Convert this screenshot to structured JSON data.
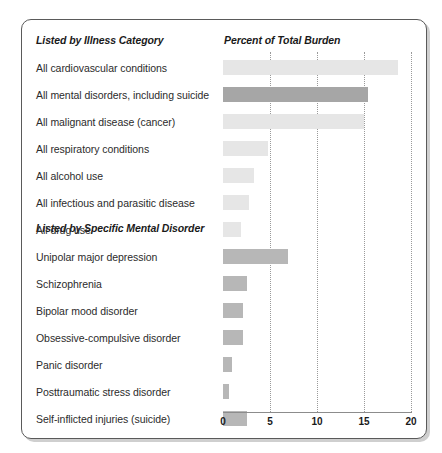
{
  "headers": {
    "illness_category": "Listed by Illness Category",
    "percent_of_total_burden": "Percent of Total Burden",
    "specific_mental_disorder": "Listed by Specific Mental Disorder"
  },
  "axis": {
    "ticks": [
      "0",
      "5",
      "10",
      "15",
      "20"
    ]
  },
  "colors": {
    "bar_light": "#e6e6e6",
    "bar_dark": "#a6a6a6",
    "bar_mid": "#b7b7b7",
    "frame": "#5a5a5a",
    "gridline": "#9a9a9a",
    "text": "#2b2b2b"
  },
  "chart_data": {
    "type": "bar",
    "title": "",
    "xlabel": "Percent of Total Burden",
    "ylabel": "",
    "xlim": [
      0,
      20
    ],
    "orientation": "horizontal",
    "grid": true,
    "legend": "none",
    "xticks": [
      0,
      5,
      10,
      15,
      20
    ],
    "groups": [
      {
        "name": "Listed by Illness Category",
        "categories": [
          "All cardiovascular conditions",
          "All mental disorders, including suicide",
          "All malignant disease (cancer)",
          "All respiratory conditions",
          "All alcohol use",
          "All  infectious and parasitic disease",
          "All drug use"
        ],
        "values": [
          18.6,
          15.4,
          15.0,
          4.8,
          3.3,
          2.8,
          1.9
        ],
        "shades": [
          "light",
          "dark",
          "light",
          "light",
          "light",
          "light",
          "light"
        ]
      },
      {
        "name": "Listed by Specific Mental Disorder",
        "categories": [
          "Unipolar major depression",
          "Schizophrenia",
          "Bipolar mood disorder",
          "Obsessive-compulsive disorder",
          "Panic disorder",
          "Posttraumatic stress disorder",
          "Self-inflicted injuries (suicide)"
        ],
        "values": [
          6.9,
          2.6,
          2.1,
          2.1,
          1.0,
          0.6,
          2.5
        ],
        "shades": [
          "mid",
          "mid",
          "mid",
          "mid",
          "mid",
          "mid",
          "mid"
        ]
      }
    ]
  }
}
